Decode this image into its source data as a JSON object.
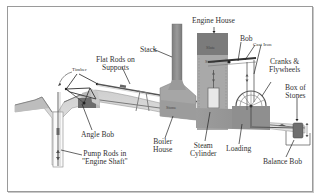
{
  "labels": {
    "engine_house": "Engine House",
    "stack": "Stack",
    "flat_rods": [
      "Flat Rods on",
      "Supports"
    ],
    "timber": "Timber",
    "bob": "Bob",
    "cast_iron": "Cast Iron",
    "cranks": [
      "Cranks &",
      "Flywheels"
    ],
    "box_of_stones": [
      "Box of",
      "Stones"
    ],
    "angle_bob": "Angle Bob",
    "pump_rods": [
      "Pump Rods in",
      "\"Engine Shaft\""
    ],
    "boiler_house": [
      "Boiler",
      "House"
    ],
    "steam_cylinder": [
      "Steam",
      "Cylinder"
    ],
    "loading": "Loading",
    "balance_bob": "Balance Bob"
  },
  "inner_labels": {
    "slate": "Slate",
    "stone_upper": "Stone",
    "stone_boiler": "Stone"
  },
  "colors": {
    "ground": "#d8d8d8",
    "ground_dark": "#9a9a9a",
    "slate": "#7b7b7b",
    "stone": "#a9a9a9",
    "stack": "#8c8c8c",
    "frame": "#9a9a9a",
    "text": "#333333"
  }
}
